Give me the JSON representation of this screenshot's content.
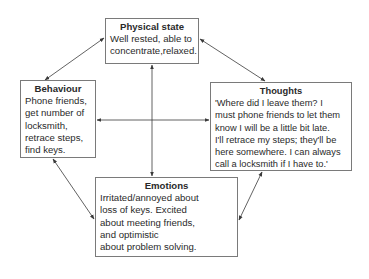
{
  "diagram": {
    "nodes": {
      "physical": {
        "title": "Physical state",
        "body": "Well rested, able to\nconcentrate,relaxed."
      },
      "behaviour": {
        "title": "Behaviour",
        "body": "Phone friends,\nget number of\nlocksmith,\nretrace steps,\nfind keys."
      },
      "thoughts": {
        "title": "Thoughts",
        "body": "'Where did I leave them? I\nmust phone friends to let them\nknow I will be a little bit late.\nI'll retrace my steps; they'll be\nhere somewhere. I can always\ncall a locksmith if I have to.'"
      },
      "emotions": {
        "title": "Emotions",
        "body": "Irritated/annoyed about\nloss of keys.  Excited\nabout meeting friends,\nand optimistic\nabout problem solving."
      }
    },
    "edges": [
      {
        "from": "physical",
        "to": "behaviour",
        "bidirectional": true
      },
      {
        "from": "physical",
        "to": "thoughts",
        "bidirectional": true
      },
      {
        "from": "physical",
        "to": "emotions",
        "bidirectional": true
      },
      {
        "from": "behaviour",
        "to": "thoughts",
        "bidirectional": true
      },
      {
        "from": "behaviour",
        "to": "emotions",
        "bidirectional": true
      },
      {
        "from": "thoughts",
        "to": "emotions",
        "bidirectional": true
      }
    ],
    "colors": {
      "line": "#3a3a3a",
      "border": "#7a7a7a",
      "text": "#2a2a2a"
    }
  }
}
